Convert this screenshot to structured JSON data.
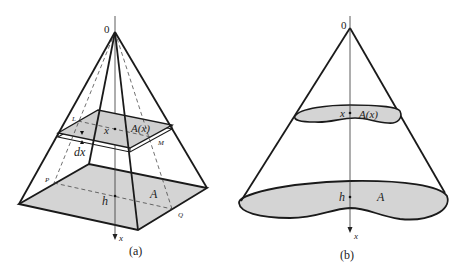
{
  "figure": {
    "panels": [
      {
        "id": "a",
        "caption": "(a)",
        "shape": "square pyramid",
        "labels": {
          "origin": "0",
          "slice_area": "A(x)",
          "slice_x": "x",
          "thickness": "dx",
          "base_area": "A",
          "height": "h",
          "axis": "x",
          "point_l": "L",
          "point_m": "M",
          "point_p": "P",
          "point_q": "Q"
        }
      },
      {
        "id": "b",
        "caption": "(b)",
        "shape": "general cone",
        "labels": {
          "origin": "0",
          "slice_area": "A(x)",
          "slice_x": "x",
          "base_area": "A",
          "height": "h",
          "axis": "x"
        }
      }
    ],
    "colors": {
      "stroke": "#1a1a1a",
      "fill": "#d4d4d4",
      "thin": "#333333"
    }
  }
}
